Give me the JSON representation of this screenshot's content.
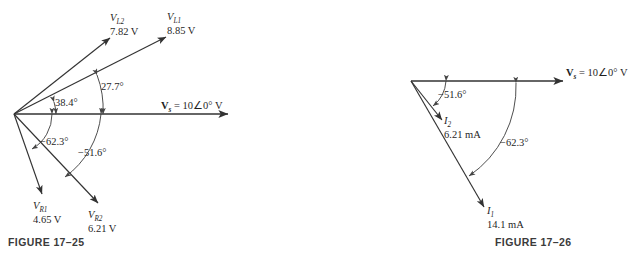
{
  "figures": [
    {
      "caption": "FIGURE 17–25",
      "source": {
        "symbol": "V",
        "subscript": "s",
        "value": "= 10∠0° V"
      },
      "vectors": [
        {
          "name": "V_L2",
          "symbol": "V",
          "subscript": "L2",
          "magnitude": "7.82 V",
          "angle_deg": 38.4
        },
        {
          "name": "V_L1",
          "symbol": "V",
          "subscript": "L1",
          "magnitude": "8.85 V",
          "angle_deg": 27.7
        },
        {
          "name": "V_R1",
          "symbol": "V",
          "subscript": "R1",
          "magnitude": "4.65 V",
          "angle_deg": -62.3
        },
        {
          "name": "V_R2",
          "symbol": "V",
          "subscript": "R2",
          "magnitude": "6.21 V",
          "angle_deg": -51.6
        }
      ],
      "angle_labels": [
        "38.4°",
        "27.7°",
        "−62.3°",
        "−51.6°"
      ]
    },
    {
      "caption": "FIGURE 17–26",
      "source": {
        "symbol": "V",
        "subscript": "s",
        "value": "= 10∠0° V"
      },
      "vectors": [
        {
          "name": "I_2",
          "symbol": "I",
          "subscript": "2",
          "magnitude": "6.21 mA",
          "angle_deg": -51.6
        },
        {
          "name": "I_1",
          "symbol": "I",
          "subscript": "1",
          "magnitude": "14.1 mA",
          "angle_deg": -62.3
        }
      ],
      "angle_labels": [
        "−51.6°",
        "−62.3°"
      ]
    }
  ],
  "colors": {
    "line": "#333333",
    "text": "#1f1f1f",
    "caption": "#3b3b3b",
    "background": "#ffffff"
  }
}
